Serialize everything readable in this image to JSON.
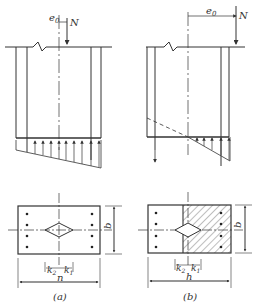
{
  "figure": {
    "panel_a": {
      "caption": "(a)",
      "load_label": "N",
      "eccentricity_label": "e",
      "eccentricity_sub": "0",
      "width_label": "b",
      "length_label": "n",
      "k2_label": "k",
      "k2_sub": "2",
      "k1_label": "k",
      "k1_sub": "1"
    },
    "panel_b": {
      "caption": "(b)",
      "load_label": "N",
      "eccentricity_label": "e",
      "eccentricity_sub": "0",
      "width_label": "b",
      "length_label": "h",
      "k2_label": "k",
      "k2_sub": "2",
      "k1_label": "k",
      "k1_sub": "1"
    },
    "colors": {
      "line": "#333333",
      "background": "#ffffff"
    }
  }
}
